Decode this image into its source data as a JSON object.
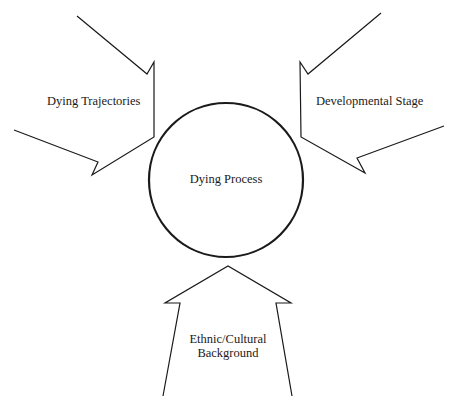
{
  "diagram": {
    "center": {
      "label": "Dying Process",
      "shape": "circle",
      "cx": 226,
      "cy": 180,
      "r": 77
    },
    "arrows": [
      {
        "id": "left",
        "label": "Dying Trajectories",
        "direction": "pointing toward center from upper-left",
        "points": "77,16 147,74 154,62 154,137 92,175 98,162 14,130"
      },
      {
        "id": "right",
        "label": "Developmental Stage",
        "direction": "pointing toward center from upper-right",
        "points": "381,13 308,74 300,62 301,137 365,173 357,158 444,126"
      },
      {
        "id": "bottom",
        "label_line1": "Ethnic/Cultural",
        "label_line2": "Background",
        "direction": "pointing up toward center",
        "points": "163,396 180,303 165,303 228,266 291,303 276,303 292,396"
      }
    ],
    "colors": {
      "stroke": "#1a1a1a",
      "background": "#ffffff"
    }
  }
}
